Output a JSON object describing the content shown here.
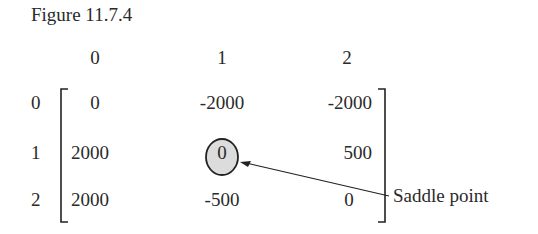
{
  "figure": {
    "title": "Figure 11.7.4",
    "column_headers": [
      "0",
      "1",
      "2"
    ],
    "row_labels": [
      "0",
      "1",
      "2"
    ],
    "matrix": [
      [
        "0",
        "-2000",
        "-2000"
      ],
      [
        "2000",
        "0",
        "500"
      ],
      [
        "2000",
        "-500",
        "0"
      ]
    ],
    "highlighted_cell": {
      "row": 1,
      "col": 1
    },
    "annotation": "Saddle point",
    "colors": {
      "text": "#2a2a2a",
      "circle_fill": "#dcdcdc",
      "circle_stroke": "#222222",
      "background": "#ffffff"
    }
  }
}
